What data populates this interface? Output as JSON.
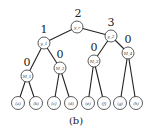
{
  "caption": "(b)",
  "nodes": [
    {
      "id": "root",
      "label": "y_r",
      "weight": "2",
      "x": 77,
      "y": 27
    },
    {
      "id": "y1",
      "label": "y_1",
      "weight": "1",
      "x": 44,
      "y": 43
    },
    {
      "id": "y2",
      "label": "y_2",
      "weight": "3",
      "x": 111,
      "y": 36
    },
    {
      "id": "M1",
      "label": "M_1",
      "weight": "0",
      "x": 27,
      "y": 76
    },
    {
      "id": "M2",
      "label": "M_2",
      "weight": "0",
      "x": 60,
      "y": 68
    },
    {
      "id": "M3",
      "label": "M_3",
      "weight": "0",
      "x": 94,
      "y": 61
    },
    {
      "id": "M4",
      "label": "M_4",
      "weight": "0",
      "x": 128,
      "y": 53
    }
  ],
  "leaves": [
    {
      "label": "(a)",
      "x": 18,
      "y": 103,
      "parent": "M1"
    },
    {
      "label": "(b)",
      "x": 36,
      "y": 103,
      "parent": "M1"
    },
    {
      "label": "(c)",
      "x": 54,
      "y": 103,
      "parent": "M2"
    },
    {
      "label": "(d)",
      "x": 71,
      "y": 103,
      "parent": "M2"
    },
    {
      "label": "(e)",
      "x": 88,
      "y": 103,
      "parent": "M3"
    },
    {
      "label": "(f)",
      "x": 104,
      "y": 103,
      "parent": "M3"
    },
    {
      "label": "(g)",
      "x": 120,
      "y": 103,
      "parent": "M4"
    },
    {
      "label": "(h)",
      "x": 136,
      "y": 103,
      "parent": "M4"
    }
  ]
}
